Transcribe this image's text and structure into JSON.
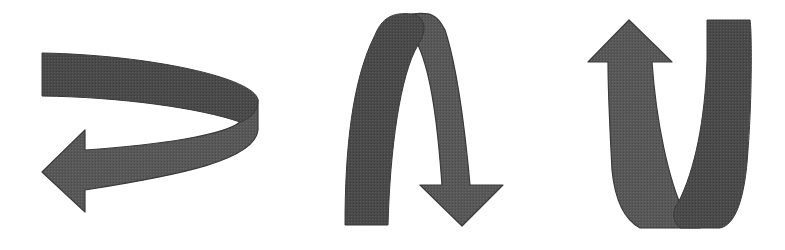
{
  "figure": {
    "background": "#ffffff",
    "colors": {
      "front_face": "#4a4a4a",
      "back_face": "#5c5c5c",
      "edge": "#3a3a3a"
    },
    "arrows": [
      {
        "id": "curved-left-arrow",
        "description": "ribbon arrow curving right then back to point left"
      },
      {
        "id": "arch-down-arrow",
        "description": "ribbon arrow arching up and over to point down"
      },
      {
        "id": "v-up-arrow",
        "description": "ribbon arrow dipping down in a V and pointing up"
      }
    ]
  }
}
